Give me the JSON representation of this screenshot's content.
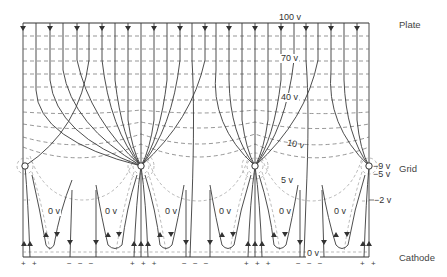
{
  "figure": {
    "electrodes": {
      "plate": "Plate",
      "grid": "Grid",
      "cathode": "Cathode"
    },
    "potential_labels": {
      "v100": "100 v",
      "v70": "70 v",
      "v40": "40 v",
      "v10": "10 v",
      "v5": "5 v",
      "vm9": "−9 v",
      "vm5": "−5 v",
      "vm2": "−2 v",
      "zero": "0 v"
    },
    "zero_labels": [
      "0 v",
      "0 v",
      "0 v",
      "0 v",
      "0 v",
      "0 v",
      "0 v"
    ],
    "cathode_signs": {
      "g0": "+ +",
      "m0": "−  −  −",
      "g1": "+ + +",
      "m1": "−  −  −",
      "g2": "+ + +",
      "m2": "−  −  −",
      "g3": "+ +"
    },
    "colors": {
      "line": "#333333",
      "equipotential": "#6a6a6a",
      "background": "#ffffff"
    }
  }
}
